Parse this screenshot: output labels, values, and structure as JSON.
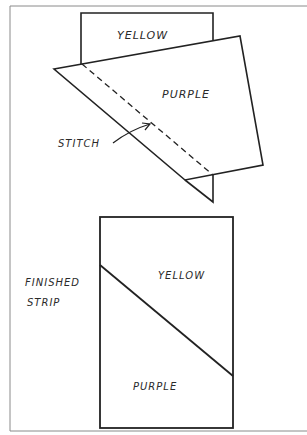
{
  "diagram": {
    "type": "sewing-instruction",
    "colors": {
      "frame": "#8a8a8a",
      "ink": "#222222",
      "background": "#ffffff"
    },
    "step1": {
      "fabric_top": {
        "label": "YELLOW"
      },
      "fabric_overlay": {
        "label": "PURPLE"
      },
      "stitch_line": {
        "label": "STITCH",
        "style": "dashed"
      }
    },
    "step2": {
      "caption_line1": "FINISHED",
      "caption_line2": "STRIP",
      "upper_region": {
        "label": "YELLOW"
      },
      "lower_region": {
        "label": "PURPLE"
      }
    }
  }
}
